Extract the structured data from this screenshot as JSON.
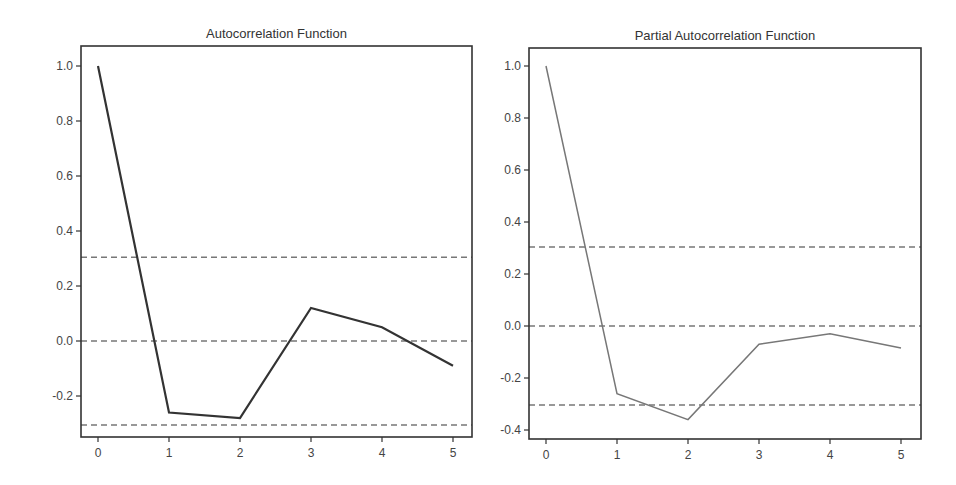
{
  "chart_data": [
    {
      "type": "line",
      "title": "Autocorrelation Function",
      "xlabel": "",
      "ylabel": "",
      "x": [
        0,
        1,
        2,
        3,
        4,
        5
      ],
      "values": [
        1.0,
        -0.26,
        -0.28,
        0.12,
        0.05,
        -0.09
      ],
      "xticks": [
        "0",
        "1",
        "2",
        "3",
        "4",
        "5"
      ],
      "yticks": [
        "1.0",
        "0.8",
        "0.6",
        "0.4",
        "0.2",
        "0.0",
        "-0.2"
      ],
      "ytick_values": [
        1.0,
        0.8,
        0.6,
        0.4,
        0.2,
        0.0,
        -0.2
      ],
      "ylim": [
        -0.34,
        1.07
      ],
      "xlim": [
        -0.25,
        5.25
      ],
      "reference_lines": [
        {
          "y": 0.305,
          "style": "dashed",
          "label": "upper confidence bound"
        },
        {
          "y": 0.0,
          "style": "dashed",
          "label": "zero"
        },
        {
          "y": -0.305,
          "style": "dashed",
          "label": "lower confidence bound"
        }
      ],
      "line_color": "#333333",
      "line_width": 2.2,
      "grid": false,
      "legend": null,
      "layout": {
        "left": 81,
        "top": 46,
        "right": 472,
        "bottom": 437,
        "x0px": 98,
        "x5px": 453,
        "y0px": 341,
        "pxPerUnit": 275
      }
    },
    {
      "type": "line",
      "title": "Partial Autocorrelation Function",
      "xlabel": "",
      "ylabel": "",
      "x": [
        0,
        1,
        2,
        3,
        4,
        5
      ],
      "values": [
        1.0,
        -0.26,
        -0.36,
        -0.07,
        -0.03,
        -0.085
      ],
      "xticks": [
        "0",
        "1",
        "2",
        "3",
        "4",
        "5"
      ],
      "yticks": [
        "1.0",
        "0.8",
        "0.6",
        "0.4",
        "0.2",
        "0.0",
        "-0.2",
        "-0.4"
      ],
      "ytick_values": [
        1.0,
        0.8,
        0.6,
        0.4,
        0.2,
        0.0,
        -0.2,
        -0.4
      ],
      "ylim": [
        -0.43,
        1.07
      ],
      "xlim": [
        -0.25,
        5.25
      ],
      "reference_lines": [
        {
          "y": 0.304,
          "style": "dashed",
          "label": "upper confidence bound"
        },
        {
          "y": 0.0,
          "style": "dashed",
          "label": "zero"
        },
        {
          "y": -0.304,
          "style": "dashed",
          "label": "lower confidence bound"
        }
      ],
      "line_color": "#777777",
      "line_width": 1.5,
      "grid": false,
      "legend": null,
      "layout": {
        "left": 529,
        "top": 48,
        "right": 921,
        "bottom": 439,
        "x0px": 546,
        "x5px": 901,
        "y0px": 326,
        "pxPerUnit": 260
      }
    }
  ]
}
